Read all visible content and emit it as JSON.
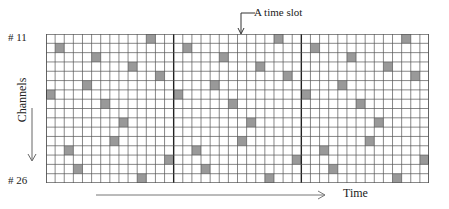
{
  "labels": {
    "top_channel": "# 11",
    "bottom_channel": "# 26",
    "y_axis": "Channels",
    "x_axis": "Time",
    "annotation": "A time slot"
  },
  "grid": {
    "rows": 16,
    "cols": 42,
    "blocks": 3,
    "cols_per_block": 14,
    "first_channel": 11,
    "last_channel": 26,
    "colors": {
      "line": "#555555",
      "block_separator": "#222222",
      "filled": "#999999",
      "background": "#ffffff"
    },
    "pattern_per_block": [
      {
        "row": 0,
        "col": 11
      },
      {
        "row": 1,
        "col": 1
      },
      {
        "row": 2,
        "col": 5
      },
      {
        "row": 3,
        "col": 9
      },
      {
        "row": 4,
        "col": 12
      },
      {
        "row": 5,
        "col": 4
      },
      {
        "row": 6,
        "col": 0
      },
      {
        "row": 7,
        "col": 6
      },
      {
        "row": 9,
        "col": 8
      },
      {
        "row": 11,
        "col": 7
      },
      {
        "row": 12,
        "col": 2
      },
      {
        "row": 13,
        "col": 13
      },
      {
        "row": 14,
        "col": 3
      },
      {
        "row": 15,
        "col": 10
      }
    ]
  }
}
